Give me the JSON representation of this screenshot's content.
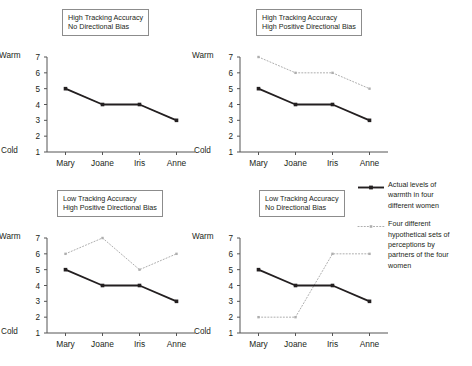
{
  "figure": {
    "width": 472,
    "height": 366,
    "background": "#ffffff"
  },
  "axis_labels": {
    "top": "Warm",
    "bottom": "Cold"
  },
  "legend": {
    "items": [
      {
        "style": "solid",
        "color": "#231f20",
        "marker": "square",
        "lines": [
          "Actual levels of",
          "warmth in four",
          "different women"
        ]
      },
      {
        "style": "dotted",
        "color": "#aeaeae",
        "marker": "square",
        "lines": [
          "Four different",
          "hypothetical sets of",
          "perceptions by",
          "partners of the four",
          "women"
        ]
      }
    ]
  },
  "chart_data": [
    {
      "id": "panel-high-accuracy-no-bias",
      "type": "line",
      "title": "High Tracking Accuracy\nNo Directional Bias",
      "title_lines": [
        "High Tracking Accuracy",
        "No Directional Bias"
      ],
      "categories": [
        "Mary",
        "Joane",
        "Iris",
        "Anne"
      ],
      "xlabel": "",
      "ylabel": "",
      "ylim": [
        1,
        7
      ],
      "yticks": [
        1,
        2,
        3,
        4,
        5,
        6,
        7
      ],
      "ytick_labels": [
        "1",
        "2",
        "3",
        "4",
        "5",
        "6",
        "7"
      ],
      "y_axis_top_label": "Warm",
      "y_axis_bottom_label": "Cold",
      "grid": false,
      "series": [
        {
          "name": "Actual levels of warmth in four different women",
          "style": "solid",
          "color": "#231f20",
          "values": [
            5,
            4,
            4,
            3
          ]
        },
        {
          "name": "Four different hypothetical sets of perceptions by partners of the four women",
          "style": "dotted",
          "color": "#aeaeae",
          "values": [
            5,
            4,
            4,
            3
          ]
        }
      ]
    },
    {
      "id": "panel-high-accuracy-high-bias",
      "type": "line",
      "title": "High Tracking Accuracy\nHigh Positive Directional Bias",
      "title_lines": [
        "High Tracking Accuracy",
        "High Positive Directional Bias"
      ],
      "categories": [
        "Mary",
        "Joane",
        "Iris",
        "Anne"
      ],
      "xlabel": "",
      "ylabel": "",
      "ylim": [
        1,
        7
      ],
      "yticks": [
        1,
        2,
        3,
        4,
        5,
        6,
        7
      ],
      "ytick_labels": [
        "1",
        "2",
        "3",
        "4",
        "5",
        "6",
        "7"
      ],
      "y_axis_top_label": "Warm",
      "y_axis_bottom_label": "Cold",
      "grid": false,
      "series": [
        {
          "name": "Actual levels of warmth in four different women",
          "style": "solid",
          "color": "#231f20",
          "values": [
            5,
            4,
            4,
            3
          ]
        },
        {
          "name": "Four different hypothetical sets of perceptions by partners of the four women",
          "style": "dotted",
          "color": "#aeaeae",
          "values": [
            7,
            6,
            6,
            5
          ]
        }
      ]
    },
    {
      "id": "panel-low-accuracy-high-bias",
      "type": "line",
      "title": "Low Tracking Accuracy\nHigh Positive Directional Bias",
      "title_lines": [
        "Low Tracking Accuracy",
        "High Positive Directional Bias"
      ],
      "categories": [
        "Mary",
        "Joane",
        "Iris",
        "Anne"
      ],
      "xlabel": "",
      "ylabel": "",
      "ylim": [
        1,
        7
      ],
      "yticks": [
        1,
        2,
        3,
        4,
        5,
        6,
        7
      ],
      "ytick_labels": [
        "1",
        "2",
        "3",
        "4",
        "5",
        "6",
        "7"
      ],
      "y_axis_top_label": "Warm",
      "y_axis_bottom_label": "Cold",
      "grid": false,
      "series": [
        {
          "name": "Actual levels of warmth in four different women",
          "style": "solid",
          "color": "#231f20",
          "values": [
            5,
            4,
            4,
            3
          ]
        },
        {
          "name": "Four different hypothetical sets of perceptions by partners of the four women",
          "style": "dotted",
          "color": "#aeaeae",
          "values": [
            6,
            7,
            5,
            6
          ]
        }
      ]
    },
    {
      "id": "panel-low-accuracy-no-bias",
      "type": "line",
      "title": "Low Tracking Accuracy\nNo Directional Bias",
      "title_lines": [
        "Low Tracking Accuracy",
        "No Directional Bias"
      ],
      "categories": [
        "Mary",
        "Joane",
        "Iris",
        "Anne"
      ],
      "xlabel": "",
      "ylabel": "",
      "ylim": [
        1,
        7
      ],
      "yticks": [
        1,
        2,
        3,
        4,
        5,
        6,
        7
      ],
      "ytick_labels": [
        "1",
        "2",
        "3",
        "4",
        "5",
        "6",
        "7"
      ],
      "y_axis_top_label": "Warm",
      "y_axis_bottom_label": "Cold",
      "grid": false,
      "series": [
        {
          "name": "Actual levels of warmth in four different women",
          "style": "solid",
          "color": "#231f20",
          "values": [
            5,
            4,
            4,
            3
          ]
        },
        {
          "name": "Four different hypothetical sets of perceptions by partners of the four women",
          "style": "dotted",
          "color": "#aeaeae",
          "values": [
            2,
            2,
            6,
            6
          ]
        }
      ]
    }
  ],
  "layout": {
    "panels": [
      {
        "left": 0,
        "top": 0,
        "title_left": 62,
        "title_top": 9,
        "plot_left": 47,
        "plot_top": 57,
        "plot_width": 148,
        "plot_height": 95
      },
      {
        "left": 0,
        "top": 0,
        "title_left": 256,
        "title_top": 9,
        "plot_left": 240,
        "plot_top": 57,
        "plot_width": 148,
        "plot_height": 95
      },
      {
        "left": 0,
        "top": 0,
        "title_left": 57,
        "title_top": 190,
        "plot_left": 47,
        "plot_top": 238,
        "plot_width": 148,
        "plot_height": 95
      },
      {
        "left": 0,
        "top": 0,
        "title_left": 259,
        "title_top": 190,
        "plot_left": 240,
        "plot_top": 238,
        "plot_width": 148,
        "plot_height": 95
      }
    ],
    "legend": {
      "left": 358,
      "top": 180
    }
  }
}
